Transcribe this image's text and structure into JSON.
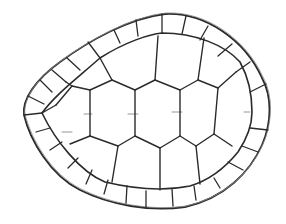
{
  "image": {
    "subject": "Pencil sketch of a turtle shell (carapace) viewed from above",
    "width": 286,
    "height": 224,
    "background": "#ffffff",
    "stroke_color": "#2a2a2a",
    "faint_stroke_color": "#8a8a8a"
  },
  "shell": {
    "outer_outline": "M 24 115 C 22 100, 35 80, 60 62 C 90 40, 130 18, 165 14 C 205 12, 245 40, 262 78 C 272 96, 272 122, 262 145 C 250 172, 225 198, 185 207 C 150 212, 110 205, 80 190 C 50 175, 30 140, 24 115 Z",
    "inner_outline": "M 42 113 C 55 95, 75 80, 100 58 C 125 42, 150 34, 162 33 C 195 33, 225 45, 240 62 C 250 80, 252 100, 252 112 C 252 125, 246 140, 238 152 C 225 168, 210 180, 190 186 C 160 192, 130 188, 105 182 C 80 172, 55 140, 42 113 Z",
    "marginal_dividers": [
      [
        24,
        115,
        42,
        113
      ],
      [
        28,
        96,
        44,
        104
      ],
      [
        40,
        80,
        52,
        92
      ],
      [
        52,
        70,
        66,
        82
      ],
      [
        67,
        58,
        80,
        70
      ],
      [
        88,
        42,
        100,
        58
      ],
      [
        114,
        30,
        120,
        43
      ],
      [
        136,
        20,
        138,
        36
      ],
      [
        162,
        14,
        162,
        33
      ],
      [
        186,
        16,
        182,
        34
      ],
      [
        208,
        26,
        200,
        40
      ],
      [
        232,
        44,
        218,
        56
      ],
      [
        250,
        62,
        236,
        72
      ],
      [
        266,
        84,
        250,
        92
      ],
      [
        268,
        130,
        250,
        128
      ],
      [
        258,
        152,
        242,
        146
      ],
      [
        243,
        170,
        228,
        162
      ],
      [
        220,
        188,
        214,
        178
      ],
      [
        196,
        200,
        194,
        186
      ],
      [
        173,
        206,
        172,
        189
      ],
      [
        146,
        208,
        146,
        191
      ],
      [
        126,
        203,
        127,
        186
      ],
      [
        104,
        194,
        108,
        180
      ],
      [
        86,
        184,
        92,
        170
      ],
      [
        68,
        168,
        78,
        158
      ],
      [
        50,
        150,
        62,
        142
      ],
      [
        36,
        132,
        50,
        128
      ]
    ],
    "scute_lines": [
      [
        100,
        58,
        112,
        80
      ],
      [
        112,
        80,
        90,
        90
      ],
      [
        90,
        90,
        72,
        86
      ],
      [
        72,
        86,
        66,
        82
      ],
      [
        112,
        80,
        135,
        90
      ],
      [
        135,
        90,
        155,
        80
      ],
      [
        155,
        80,
        158,
        36
      ],
      [
        155,
        80,
        180,
        90
      ],
      [
        180,
        90,
        198,
        80
      ],
      [
        198,
        80,
        204,
        38
      ],
      [
        198,
        80,
        218,
        88
      ],
      [
        218,
        88,
        236,
        72
      ],
      [
        218,
        88,
        214,
        134
      ],
      [
        214,
        134,
        232,
        146
      ],
      [
        214,
        134,
        196,
        146
      ],
      [
        196,
        146,
        200,
        184
      ],
      [
        196,
        146,
        180,
        136
      ],
      [
        180,
        136,
        160,
        148
      ],
      [
        160,
        148,
        160,
        190
      ],
      [
        160,
        148,
        135,
        136
      ],
      [
        135,
        136,
        118,
        146
      ],
      [
        118,
        146,
        112,
        182
      ],
      [
        118,
        146,
        90,
        136
      ],
      [
        90,
        136,
        70,
        144
      ],
      [
        90,
        90,
        90,
        136
      ],
      [
        135,
        90,
        135,
        136
      ],
      [
        180,
        90,
        180,
        136
      ],
      [
        42,
        113,
        56,
        105
      ],
      [
        56,
        105,
        72,
        86
      ]
    ],
    "faint_marks": [
      [
        84,
        114,
        92,
        114
      ],
      [
        128,
        114,
        138,
        114
      ],
      [
        172,
        112,
        182,
        112
      ],
      [
        244,
        112,
        250,
        112
      ],
      [
        62,
        132,
        72,
        132
      ]
    ]
  }
}
